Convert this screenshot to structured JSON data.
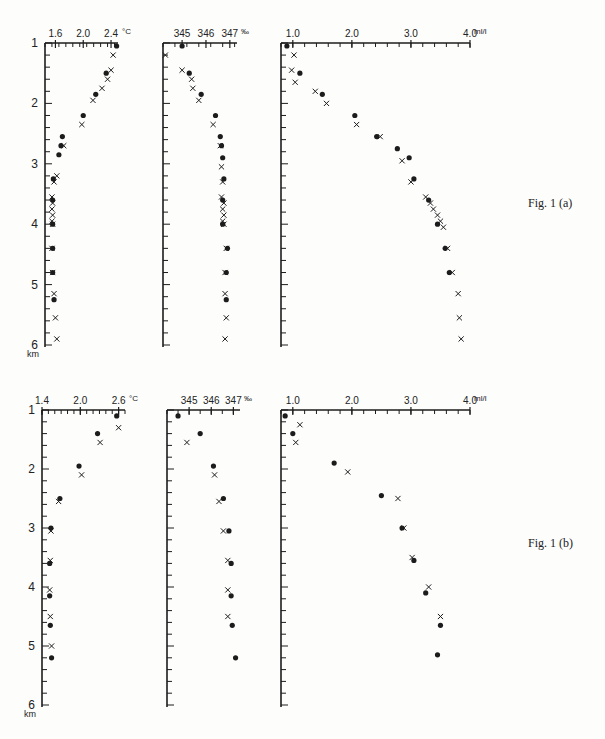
{
  "page_number": "",
  "captions": {
    "fig_a": "Fig. 1 (a)",
    "fig_b": "Fig. 1 (b)"
  },
  "legend": {
    "dot": "•",
    "cross": "×"
  },
  "chart_data": [
    {
      "id": "fig1a_temperature",
      "figure": "Fig. 1 (a)",
      "type": "scatter",
      "title": "",
      "xlabel": "°C",
      "ylabel": "km",
      "x_ticks": [
        "1.6",
        "2.0",
        "2.4"
      ],
      "x_unit": "°C",
      "xlim": [
        1.45,
        2.5
      ],
      "ylim": [
        6,
        1
      ],
      "y_ticks": [
        "1",
        "2",
        "3",
        "4",
        "5",
        "6"
      ],
      "y_unit": "km",
      "series": [
        {
          "name": "dot",
          "points": [
            [
              2.48,
              1.05
            ],
            [
              2.33,
              1.5
            ],
            [
              2.18,
              1.85
            ],
            [
              2.0,
              2.2
            ],
            [
              1.7,
              2.55
            ],
            [
              1.68,
              2.7
            ],
            [
              1.65,
              2.85
            ],
            [
              1.57,
              3.25
            ],
            [
              1.56,
              3.6
            ],
            [
              1.56,
              4.0
            ],
            [
              1.56,
              4.4
            ],
            [
              1.56,
              4.8
            ],
            [
              1.58,
              5.25
            ]
          ]
        },
        {
          "name": "cross",
          "points": [
            [
              2.43,
              1.2
            ],
            [
              2.4,
              1.45
            ],
            [
              2.35,
              1.6
            ],
            [
              2.27,
              1.75
            ],
            [
              2.14,
              1.95
            ],
            [
              1.98,
              2.35
            ],
            [
              1.72,
              2.7
            ],
            [
              1.62,
              3.2
            ],
            [
              1.58,
              3.3
            ],
            [
              1.55,
              3.55
            ],
            [
              1.56,
              3.65
            ],
            [
              1.55,
              3.75
            ],
            [
              1.56,
              3.85
            ],
            [
              1.55,
              3.95
            ],
            [
              1.56,
              4.0
            ],
            [
              1.55,
              4.4
            ],
            [
              1.56,
              4.8
            ],
            [
              1.58,
              5.15
            ],
            [
              1.6,
              5.55
            ],
            [
              1.62,
              5.9
            ]
          ]
        }
      ]
    },
    {
      "id": "fig1a_salinity",
      "figure": "Fig. 1 (a)",
      "type": "scatter",
      "xlabel": "‰",
      "ylabel": "km",
      "x_ticks": [
        "34.5",
        "34.6",
        "34.7"
      ],
      "x_tick_text": [
        "345",
        "346",
        "347"
      ],
      "x_unit": "‰",
      "xlim": [
        34.42,
        34.73
      ],
      "ylim": [
        6,
        1
      ],
      "series": [
        {
          "name": "dot",
          "points": [
            [
              34.5,
              1.05
            ],
            [
              34.53,
              1.5
            ],
            [
              34.58,
              1.85
            ],
            [
              34.64,
              2.2
            ],
            [
              34.66,
              2.55
            ],
            [
              34.665,
              2.7
            ],
            [
              34.67,
              2.9
            ],
            [
              34.675,
              3.25
            ],
            [
              34.67,
              3.6
            ],
            [
              34.67,
              4.0
            ],
            [
              34.69,
              4.4
            ],
            [
              34.685,
              4.8
            ],
            [
              34.685,
              5.25
            ]
          ]
        },
        {
          "name": "cross",
          "points": [
            [
              34.43,
              1.2
            ],
            [
              34.5,
              1.45
            ],
            [
              34.54,
              1.6
            ],
            [
              34.545,
              1.75
            ],
            [
              34.57,
              1.95
            ],
            [
              34.63,
              2.35
            ],
            [
              34.66,
              2.7
            ],
            [
              34.665,
              3.05
            ],
            [
              34.67,
              3.3
            ],
            [
              34.665,
              3.55
            ],
            [
              34.675,
              3.65
            ],
            [
              34.67,
              3.75
            ],
            [
              34.675,
              3.85
            ],
            [
              34.67,
              3.95
            ],
            [
              34.675,
              4.0
            ],
            [
              34.685,
              4.4
            ],
            [
              34.68,
              4.8
            ],
            [
              34.68,
              5.15
            ],
            [
              34.685,
              5.55
            ],
            [
              34.68,
              5.9
            ]
          ]
        }
      ]
    },
    {
      "id": "fig1a_oxygen",
      "figure": "Fig. 1 (a)",
      "type": "scatter",
      "xlabel": "ml/l",
      "ylabel": "km",
      "x_ticks": [
        "1.0",
        "2.0",
        "3.0",
        "4.0"
      ],
      "x_unit": "ml/l",
      "xlim": [
        0.8,
        4.0
      ],
      "ylim": [
        6,
        1
      ],
      "series": [
        {
          "name": "dot",
          "points": [
            [
              0.9,
              1.05
            ],
            [
              1.12,
              1.5
            ],
            [
              1.5,
              1.85
            ],
            [
              2.05,
              2.2
            ],
            [
              2.42,
              2.55
            ],
            [
              2.77,
              2.75
            ],
            [
              2.97,
              2.9
            ],
            [
              3.05,
              3.25
            ],
            [
              3.3,
              3.6
            ],
            [
              3.45,
              4.0
            ],
            [
              3.58,
              4.4
            ],
            [
              3.65,
              4.8
            ]
          ]
        },
        {
          "name": "cross",
          "points": [
            [
              1.02,
              1.2
            ],
            [
              0.98,
              1.45
            ],
            [
              1.04,
              1.65
            ],
            [
              1.38,
              1.8
            ],
            [
              1.57,
              2.0
            ],
            [
              2.08,
              2.35
            ],
            [
              2.48,
              2.55
            ],
            [
              2.85,
              2.95
            ],
            [
              3.0,
              3.3
            ],
            [
              3.25,
              3.55
            ],
            [
              3.33,
              3.65
            ],
            [
              3.38,
              3.75
            ],
            [
              3.45,
              3.85
            ],
            [
              3.5,
              3.95
            ],
            [
              3.55,
              4.05
            ],
            [
              3.62,
              4.4
            ],
            [
              3.7,
              4.8
            ],
            [
              3.8,
              5.15
            ],
            [
              3.82,
              5.55
            ],
            [
              3.85,
              5.9
            ]
          ]
        }
      ]
    },
    {
      "id": "fig1b_temperature",
      "figure": "Fig. 1 (b)",
      "type": "scatter",
      "xlabel": "°C",
      "ylabel": "km",
      "x_ticks": [
        "1.4",
        "2.0",
        "2.6"
      ],
      "x_unit": "°C",
      "xlim": [
        1.4,
        2.7
      ],
      "ylim": [
        6,
        1
      ],
      "series": [
        {
          "name": "dot",
          "points": [
            [
              2.57,
              1.1
            ],
            [
              2.27,
              1.4
            ],
            [
              1.98,
              1.95
            ],
            [
              1.68,
              2.5
            ],
            [
              1.54,
              3.0
            ],
            [
              1.52,
              3.6
            ],
            [
              1.52,
              4.15
            ],
            [
              1.53,
              4.65
            ],
            [
              1.55,
              5.2
            ]
          ]
        },
        {
          "name": "cross",
          "points": [
            [
              2.6,
              1.3
            ],
            [
              2.31,
              1.55
            ],
            [
              2.02,
              2.1
            ],
            [
              1.66,
              2.55
            ],
            [
              1.54,
              3.05
            ],
            [
              1.53,
              3.55
            ],
            [
              1.52,
              4.05
            ],
            [
              1.53,
              4.5
            ],
            [
              1.55,
              5.0
            ]
          ]
        }
      ]
    },
    {
      "id": "fig1b_salinity",
      "figure": "Fig. 1 (b)",
      "type": "scatter",
      "xlabel": "‰",
      "ylabel": "km",
      "x_ticks": [
        "34.5",
        "34.6",
        "34.7"
      ],
      "x_tick_text": [
        "345",
        "346",
        "347"
      ],
      "x_unit": "‰",
      "xlim": [
        34.4,
        34.73
      ],
      "ylim": [
        6,
        1
      ],
      "series": [
        {
          "name": "dot",
          "points": [
            [
              34.45,
              1.1
            ],
            [
              34.55,
              1.4
            ],
            [
              34.61,
              1.95
            ],
            [
              34.655,
              2.5
            ],
            [
              34.68,
              3.05
            ],
            [
              34.69,
              3.6
            ],
            [
              34.69,
              4.15
            ],
            [
              34.695,
              4.65
            ],
            [
              34.71,
              5.2
            ]
          ]
        },
        {
          "name": "cross",
          "points": [
            [
              34.49,
              1.55
            ],
            [
              34.615,
              2.1
            ],
            [
              34.635,
              2.55
            ],
            [
              34.655,
              3.05
            ],
            [
              34.675,
              3.55
            ],
            [
              34.675,
              4.05
            ],
            [
              34.675,
              4.5
            ]
          ]
        }
      ]
    },
    {
      "id": "fig1b_oxygen",
      "figure": "Fig. 1 (b)",
      "type": "scatter",
      "xlabel": "ml/l",
      "ylabel": "km",
      "x_ticks": [
        "1.0",
        "2.0",
        "3.0",
        "4.0"
      ],
      "x_unit": "ml/l",
      "xlim": [
        0.8,
        4.0
      ],
      "ylim": [
        6,
        1
      ],
      "series": [
        {
          "name": "dot",
          "points": [
            [
              0.87,
              1.1
            ],
            [
              1.0,
              1.4
            ],
            [
              1.7,
              1.9
            ],
            [
              2.5,
              2.45
            ],
            [
              2.85,
              3.0
            ],
            [
              3.05,
              3.55
            ],
            [
              3.25,
              4.1
            ],
            [
              3.5,
              4.65
            ],
            [
              3.45,
              5.15
            ]
          ]
        },
        {
          "name": "cross",
          "points": [
            [
              1.12,
              1.25
            ],
            [
              1.05,
              1.55
            ],
            [
              1.93,
              2.05
            ],
            [
              2.78,
              2.5
            ],
            [
              2.88,
              3.0
            ],
            [
              3.02,
              3.5
            ],
            [
              3.3,
              4.0
            ],
            [
              3.5,
              4.5
            ]
          ]
        }
      ]
    }
  ]
}
